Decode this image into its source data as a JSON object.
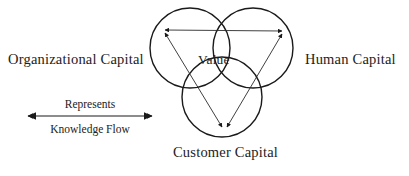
{
  "diagram": {
    "title_visible": false,
    "background_color": "#ffffff",
    "stroke_color": "#1a1a1a",
    "thin_stroke_color": "#3a3a3a",
    "text_color": "#222222",
    "labels": {
      "left": "Organizational Capital",
      "right": "Human Capital",
      "bottom": "Customer Capital",
      "center": "Value"
    },
    "legend": {
      "top_label": "Represents",
      "bottom_label": "Knowledge Flow",
      "arrow_name": "double-headed-arrow"
    },
    "circles": [
      {
        "name": "organizational-capital-circle",
        "cx": 190,
        "cy": 48,
        "r": 40
      },
      {
        "name": "human-capital-circle",
        "cx": 253,
        "cy": 48,
        "r": 40
      },
      {
        "name": "customer-capital-circle",
        "cx": 222,
        "cy": 97,
        "r": 40
      }
    ],
    "flow_arrows": [
      {
        "name": "flow-left-to-right",
        "x1": 162,
        "y1": 30,
        "x2": 285,
        "y2": 31
      },
      {
        "name": "flow-left-to-bottom",
        "x1": 162,
        "y1": 30,
        "x2": 224,
        "y2": 130
      },
      {
        "name": "flow-right-to-bottom",
        "x1": 285,
        "y1": 31,
        "x2": 224,
        "y2": 130
      }
    ]
  }
}
